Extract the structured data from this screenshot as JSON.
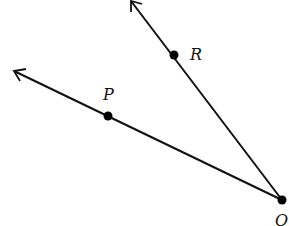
{
  "diagram": {
    "type": "angle-with-rays",
    "vertex": {
      "label": "O",
      "x": 282,
      "y": 200
    },
    "rays": [
      {
        "name": "ray-OR",
        "through": {
          "label": "R",
          "x": 174,
          "y": 55
        },
        "tip": {
          "x": 131,
          "y": 1
        }
      },
      {
        "name": "ray-OP",
        "through": {
          "label": "P",
          "x": 108,
          "y": 116
        },
        "tip": {
          "x": 14,
          "y": 71
        }
      }
    ],
    "labels": {
      "R": {
        "text": "R",
        "x": 190,
        "y": 60
      },
      "P": {
        "text": "P",
        "x": 103,
        "y": 100
      },
      "O": {
        "text": "O",
        "x": 275,
        "y": 226
      }
    },
    "colors": {
      "line": "#111111",
      "point": "#000000",
      "background": "#ffffff"
    }
  }
}
